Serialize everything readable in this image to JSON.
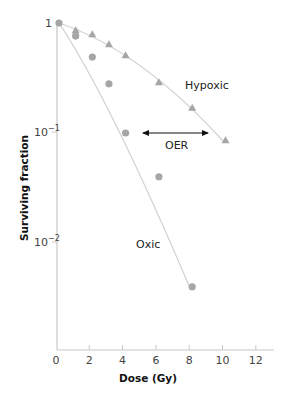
{
  "chart_data": {
    "type": "scatter",
    "title": "",
    "xlabel": "Dose (Gy)",
    "ylabel": "Surviving fraction",
    "x_ticks": [
      "0",
      "2",
      "4",
      "6",
      "8",
      "10",
      "12"
    ],
    "y_ticks": [
      {
        "base": "1",
        "exp": ""
      },
      {
        "base": "10",
        "exp": "−1"
      },
      {
        "base": "10",
        "exp": "−2"
      }
    ],
    "xlim": [
      0,
      13
    ],
    "ylim": [
      0.001,
      1
    ],
    "yscale": "log",
    "grid": false,
    "series": [
      {
        "name": "Hypoxic",
        "marker": "triangle",
        "color": "#a6a6a6",
        "x": [
          0,
          1,
          2,
          3,
          4,
          6,
          8,
          10
        ],
        "y": [
          1.0,
          0.86,
          0.79,
          0.64,
          0.51,
          0.29,
          0.17,
          0.086
        ]
      },
      {
        "name": "Oxic",
        "marker": "circle",
        "color": "#a6a6a6",
        "x": [
          0,
          1,
          2,
          3,
          4,
          6,
          8
        ],
        "y": [
          1.0,
          0.76,
          0.49,
          0.28,
          0.1,
          0.04,
          0.004
        ]
      }
    ],
    "annotations": [
      {
        "text": "Hypoxic",
        "label_for": "Hypoxic"
      },
      {
        "text": "Oxic",
        "label_for": "Oxic"
      },
      {
        "text": "OER",
        "type": "double-arrow",
        "x_from": 5.2,
        "x_to": 9.2,
        "y": 0.1
      }
    ]
  },
  "labels": {
    "hypoxic": "Hypoxic",
    "oxic": "Oxic",
    "oer": "OER",
    "xlabel": "Dose (Gy)",
    "ylabel": "Surviving fraction"
  }
}
